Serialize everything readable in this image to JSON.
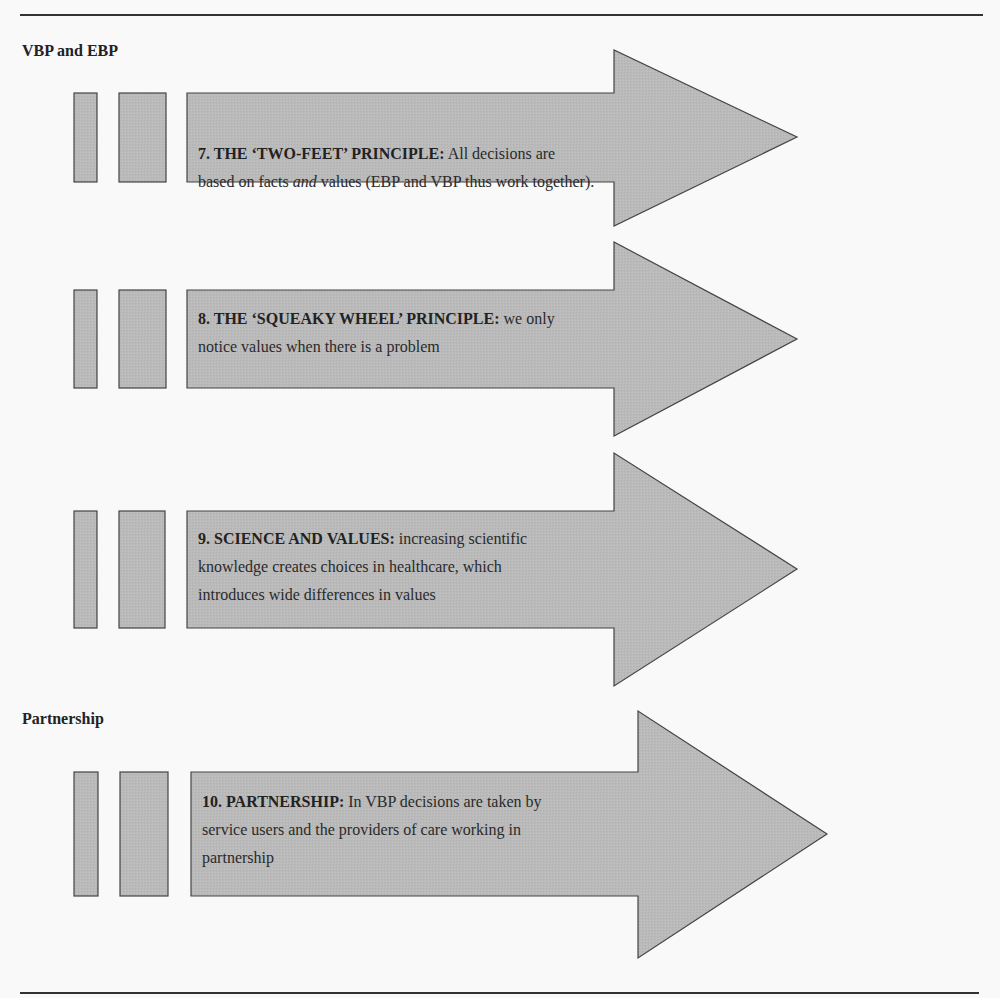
{
  "colors": {
    "page_background": "#f9f9f9",
    "shape_fill": "#b9b9b9",
    "shape_stroke": "#444444",
    "text": "#2a2a2a",
    "rule": "#333333"
  },
  "sections": [
    {
      "heading": "VBP and EBP"
    },
    {
      "heading": "Partnership"
    }
  ],
  "principles": [
    {
      "number": "7.",
      "title": "THE ‘TWO-FEET’ PRINCIPLE:",
      "body_before_emphasis": "All decisions are based on facts ",
      "emphasis": "and",
      "body_after_emphasis": " values (EBP and VBP thus work together).",
      "lines": [
        "7.  THE ‘TWO-FEET’ PRINCIPLE: All decisions are",
        "based on facts and values (EBP and VBP thus work together)."
      ]
    },
    {
      "number": "8.",
      "title": "THE ‘SQUEAKY WHEEL’ PRINCIPLE:",
      "body": "we only notice values when there is a problem",
      "lines": [
        "8.  THE ‘SQUEAKY WHEEL’ PRINCIPLE: we only",
        "notice values when there is a problem"
      ]
    },
    {
      "number": "9.",
      "title": "SCIENCE AND VALUES:",
      "body": "increasing scientific knowledge creates choices in healthcare, which introduces wide differences in values",
      "lines": [
        "9. SCIENCE AND VALUES: increasing scientific",
        "knowledge creates choices in healthcare, which",
        "introduces wide differences in values"
      ]
    },
    {
      "number": "10.",
      "title": "PARTNERSHIP:",
      "body": "In VBP decisions are taken by service users and the providers of care working in partnership",
      "lines": [
        "10. PARTNERSHIP: In VBP decisions are taken by",
        "service users and the providers of care working in",
        "partnership"
      ]
    }
  ],
  "text_parts": {
    "p7": {
      "title": "7.  THE ‘TWO-FEET’ PRINCIPLE:",
      "l1_rest": " All decisions are",
      "l2_a": "based on facts ",
      "l2_em": "and",
      "l2_b": " values (EBP and VBP thus work together)."
    },
    "p8": {
      "title": "8.  THE ‘SQUEAKY WHEEL’ PRINCIPLE:",
      "l1_rest": " we only",
      "l2": "notice values when there is a problem"
    },
    "p9": {
      "title": "9. SCIENCE AND VALUES:",
      "l1_rest": " increasing scientific",
      "l2": "knowledge creates choices in healthcare, which",
      "l3": "introduces wide differences in values"
    },
    "p10": {
      "title": "10. PARTNERSHIP:",
      "l1_rest": " In VBP decisions are taken by",
      "l2": "service users and the providers of care working in",
      "l3": "partnership"
    }
  }
}
